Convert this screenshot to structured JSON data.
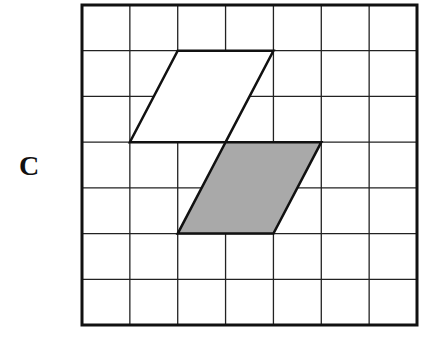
{
  "label": "C",
  "grid": {
    "cols": 7,
    "rows": 7,
    "left": 82,
    "top": 5,
    "right": 417,
    "bottom": 325
  },
  "shapes": [
    {
      "name": "white-parallelogram",
      "fill": "#ffffff",
      "points_grid": [
        [
          2,
          1
        ],
        [
          4,
          1
        ],
        [
          3,
          3
        ],
        [
          1,
          3
        ]
      ]
    },
    {
      "name": "shaded-parallelogram",
      "fill": "#a9a9a9",
      "points_grid": [
        [
          3,
          3
        ],
        [
          5,
          3
        ],
        [
          4,
          5
        ],
        [
          2,
          5
        ]
      ]
    }
  ]
}
